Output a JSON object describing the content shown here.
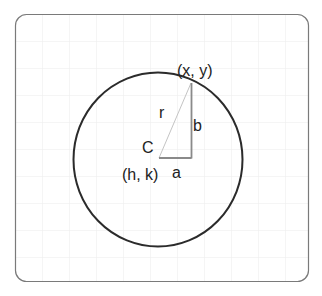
{
  "diagram": {
    "labels": {
      "point": "(x, y)",
      "radius": "r",
      "vertical_leg": "b",
      "center_name": "C",
      "center_coords": "(h, k)",
      "horizontal_leg": "a"
    },
    "colors": {
      "frame": "#7a7a7a",
      "grid": "#ececec",
      "circle": "#2b2b2b",
      "legs": "#8a8a8a",
      "radius_line": "#c4c4c4",
      "text": "#222222"
    }
  }
}
